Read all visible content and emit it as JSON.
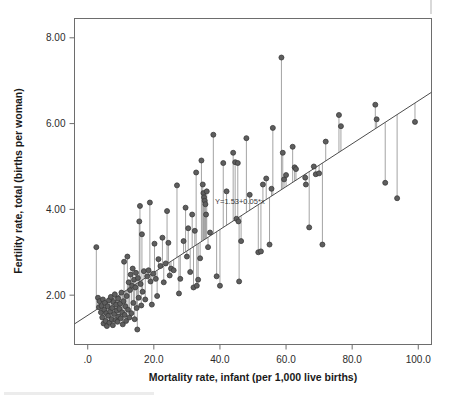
{
  "chart_data": {
    "type": "scatter",
    "title": "",
    "xlabel": "Mortality rate, infant (per 1,000 live births)",
    "ylabel": "Fertility rate, total (births per woman)",
    "xlim": [
      -4.0,
      104.0
    ],
    "ylim": [
      0.85,
      8.45
    ],
    "xticks": [
      0,
      20,
      40,
      60,
      80,
      100
    ],
    "xticklabels": [
      ".0",
      "20.0",
      "40.0",
      "60.0",
      "80.0",
      "100.0"
    ],
    "yticks": [
      2,
      4,
      6,
      8
    ],
    "yticklabels": [
      "2.00",
      "4.00",
      "6.00",
      "8.00"
    ],
    "grid": false,
    "legend": null,
    "annotation": "Y=1.53+0.05*x",
    "fit": {
      "type": "linear",
      "intercept": 1.53,
      "slope": 0.05,
      "equation": "Y=1.53+0.05*x",
      "residual_lines": true
    },
    "marker": {
      "shape": "circle",
      "size": 5,
      "fill": "#5e5e5e",
      "edge": "#3b3b3b"
    },
    "points": [
      [
        2.6,
        3.12
      ],
      [
        3.1,
        1.94
      ],
      [
        3.4,
        1.72
      ],
      [
        3.6,
        1.86
      ],
      [
        4.0,
        1.6
      ],
      [
        4.2,
        1.75
      ],
      [
        4.4,
        1.48
      ],
      [
        4.6,
        1.9
      ],
      [
        4.8,
        1.34
      ],
      [
        5.0,
        1.66
      ],
      [
        5.2,
        1.82
      ],
      [
        5.4,
        1.4
      ],
      [
        5.6,
        1.58
      ],
      [
        5.8,
        1.28
      ],
      [
        6.0,
        1.74
      ],
      [
        6.2,
        1.52
      ],
      [
        6.4,
        1.88
      ],
      [
        6.6,
        1.36
      ],
      [
        6.8,
        1.62
      ],
      [
        7.0,
        1.96
      ],
      [
        7.2,
        1.44
      ],
      [
        7.4,
        1.7
      ],
      [
        7.6,
        1.3
      ],
      [
        7.8,
        1.84
      ],
      [
        8.0,
        1.56
      ],
      [
        8.2,
        2.02
      ],
      [
        8.4,
        1.42
      ],
      [
        8.6,
        1.78
      ],
      [
        8.8,
        1.64
      ],
      [
        9.0,
        1.38
      ],
      [
        9.2,
        1.92
      ],
      [
        9.4,
        1.5
      ],
      [
        9.6,
        1.68
      ],
      [
        9.8,
        1.8
      ],
      [
        10.0,
        1.46
      ],
      [
        10.2,
        2.06
      ],
      [
        10.4,
        1.6
      ],
      [
        10.6,
        1.32
      ],
      [
        10.8,
        1.86
      ],
      [
        11.0,
        2.78
      ],
      [
        11.2,
        1.54
      ],
      [
        11.4,
        1.74
      ],
      [
        11.6,
        1.4
      ],
      [
        11.8,
        1.98
      ],
      [
        12.0,
        2.9
      ],
      [
        12.2,
        1.66
      ],
      [
        12.4,
        2.3
      ],
      [
        12.6,
        1.48
      ],
      [
        12.8,
        2.12
      ],
      [
        13.0,
        2.48
      ],
      [
        13.2,
        1.58
      ],
      [
        13.4,
        2.22
      ],
      [
        13.6,
        2.62
      ],
      [
        13.8,
        1.82
      ],
      [
        14.0,
        2.36
      ],
      [
        14.2,
        1.44
      ],
      [
        14.4,
        2.18
      ],
      [
        14.6,
        2.52
      ],
      [
        14.8,
        1.7
      ],
      [
        15.0,
        1.2
      ],
      [
        15.2,
        2.4
      ],
      [
        15.4,
        1.94
      ],
      [
        15.6,
        3.72
      ],
      [
        15.8,
        4.08
      ],
      [
        16.0,
        2.26
      ],
      [
        16.2,
        1.76
      ],
      [
        16.4,
        3.42
      ],
      [
        16.6,
        2.08
      ],
      [
        17.0,
        2.56
      ],
      [
        17.4,
        1.9
      ],
      [
        18.0,
        2.44
      ],
      [
        18.4,
        2.58
      ],
      [
        18.8,
        4.16
      ],
      [
        19.0,
        2.32
      ],
      [
        19.4,
        1.78
      ],
      [
        19.8,
        2.5
      ],
      [
        20.2,
        3.2
      ],
      [
        20.6,
        2.38
      ],
      [
        21.0,
        1.98
      ],
      [
        21.4,
        2.84
      ],
      [
        22.0,
        2.68
      ],
      [
        22.6,
        3.34
      ],
      [
        23.0,
        2.3
      ],
      [
        23.6,
        2.74
      ],
      [
        24.0,
        3.96
      ],
      [
        24.4,
        3.22
      ],
      [
        24.8,
        2.46
      ],
      [
        25.2,
        2.62
      ],
      [
        26.0,
        2.58
      ],
      [
        27.0,
        4.56
      ],
      [
        27.6,
        2.04
      ],
      [
        28.0,
        2.38
      ],
      [
        29.0,
        3.26
      ],
      [
        29.6,
        4.04
      ],
      [
        30.0,
        2.9
      ],
      [
        30.4,
        3.56
      ],
      [
        31.0,
        2.54
      ],
      [
        31.6,
        3.88
      ],
      [
        32.0,
        2.18
      ],
      [
        32.4,
        3.5
      ],
      [
        32.8,
        4.86
      ],
      [
        33.0,
        2.22
      ],
      [
        33.4,
        2.36
      ],
      [
        34.0,
        2.86
      ],
      [
        34.4,
        5.14
      ],
      [
        34.8,
        4.58
      ],
      [
        35.0,
        4.38
      ],
      [
        35.2,
        4.28
      ],
      [
        35.4,
        4.2
      ],
      [
        35.6,
        4.12
      ],
      [
        35.8,
        3.88
      ],
      [
        36.0,
        4.42
      ],
      [
        36.4,
        3.12
      ],
      [
        37.0,
        3.46
      ],
      [
        38.0,
        5.74
      ],
      [
        39.0,
        2.44
      ],
      [
        40.0,
        2.22
      ],
      [
        41.0,
        5.08
      ],
      [
        42.0,
        4.42
      ],
      [
        44.0,
        5.32
      ],
      [
        44.6,
        5.1
      ],
      [
        45.0,
        3.78
      ],
      [
        45.4,
        5.08
      ],
      [
        45.6,
        3.72
      ],
      [
        45.8,
        2.32
      ],
      [
        46.4,
        3.26
      ],
      [
        48.0,
        5.66
      ],
      [
        49.0,
        4.34
      ],
      [
        51.6,
        3.0
      ],
      [
        52.4,
        3.02
      ],
      [
        53.0,
        4.58
      ],
      [
        54.0,
        4.72
      ],
      [
        55.0,
        3.18
      ],
      [
        55.6,
        4.48
      ],
      [
        56.0,
        5.9
      ],
      [
        58.6,
        7.54
      ],
      [
        59.0,
        5.32
      ],
      [
        59.4,
        4.7
      ],
      [
        60.0,
        4.8
      ],
      [
        62.0,
        5.46
      ],
      [
        62.6,
        4.98
      ],
      [
        63.0,
        4.94
      ],
      [
        65.8,
        4.74
      ],
      [
        66.0,
        4.58
      ],
      [
        67.0,
        3.58
      ],
      [
        68.4,
        5.0
      ],
      [
        69.0,
        4.82
      ],
      [
        70.0,
        4.84
      ],
      [
        71.0,
        3.18
      ],
      [
        72.0,
        5.58
      ],
      [
        76.0,
        6.2
      ],
      [
        76.6,
        5.94
      ],
      [
        87.0,
        6.44
      ],
      [
        87.4,
        6.1
      ],
      [
        90.0,
        4.62
      ],
      [
        93.6,
        4.26
      ],
      [
        99.0,
        6.04
      ]
    ]
  },
  "artifacts": {
    "top_right_mark": "scan-artifact",
    "bottom_smudge": "scan-artifact"
  }
}
